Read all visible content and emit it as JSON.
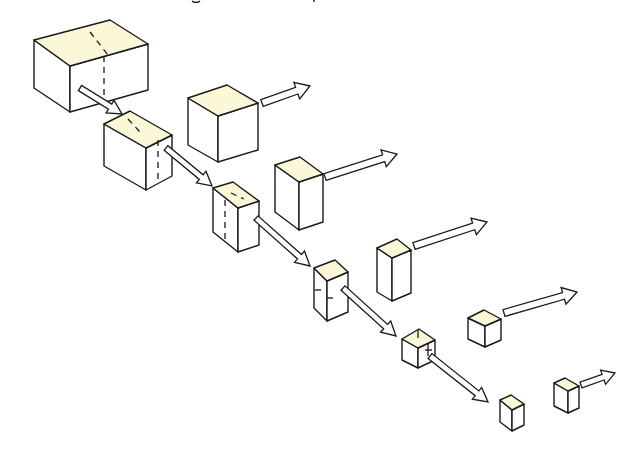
{
  "diagram": {
    "caption_clipped": true,
    "colors": {
      "top_face": "#fbf8d8",
      "side_face": "#ffffff",
      "stroke": "#1a1a1a",
      "background": "#ffffff"
    },
    "chain_boxes": [
      {
        "id": "box-1",
        "label": "original box",
        "split": "vertical-dashed",
        "top": [
          [
            34,
            40
          ],
          [
            110,
            20
          ],
          [
            148,
            44
          ],
          [
            70,
            66
          ]
        ],
        "left": [
          [
            34,
            40
          ],
          [
            70,
            66
          ],
          [
            70,
            112
          ],
          [
            34,
            88
          ]
        ],
        "front": [
          [
            70,
            66
          ],
          [
            148,
            44
          ],
          [
            148,
            90
          ],
          [
            70,
            112
          ]
        ],
        "dash_top": [
          [
            90,
            32
          ],
          [
            108,
            55
          ]
        ],
        "dash_front": [
          [
            104,
            56
          ],
          [
            104,
            104
          ]
        ]
      },
      {
        "id": "box-2",
        "label": "half 1",
        "split": "vertical-dashed",
        "top": [
          [
            104,
            124
          ],
          [
            130,
            111
          ],
          [
            172,
            135
          ],
          [
            146,
            148
          ]
        ],
        "left": [
          [
            104,
            124
          ],
          [
            146,
            148
          ],
          [
            146,
            190
          ],
          [
            104,
            166
          ]
        ],
        "front": [
          [
            146,
            148
          ],
          [
            172,
            135
          ],
          [
            172,
            176
          ],
          [
            146,
            190
          ]
        ],
        "dash_top": [
          [
            128,
            119
          ],
          [
            140,
            132
          ]
        ],
        "dash_front": [
          [
            158,
            140
          ],
          [
            158,
            182
          ]
        ]
      },
      {
        "id": "box-3",
        "label": "half 2",
        "split": "vertical-dashed",
        "top": [
          [
            213,
            188
          ],
          [
            233,
            182
          ],
          [
            259,
            201
          ],
          [
            238,
            208
          ]
        ],
        "left": [
          [
            213,
            188
          ],
          [
            238,
            208
          ],
          [
            238,
            252
          ],
          [
            213,
            232
          ]
        ],
        "front": [
          [
            238,
            208
          ],
          [
            259,
            201
          ],
          [
            259,
            245
          ],
          [
            238,
            252
          ]
        ],
        "dash_top": [
          [
            231,
            193
          ],
          [
            244,
            199
          ]
        ],
        "dash_front": [
          [
            225,
            200
          ],
          [
            225,
            243
          ]
        ]
      },
      {
        "id": "box-4",
        "label": "half 3",
        "split": "horizontal-ticks",
        "top": [
          [
            314,
            268
          ],
          [
            335,
            260
          ],
          [
            348,
            272
          ],
          [
            327,
            281
          ]
        ],
        "left": [
          [
            314,
            268
          ],
          [
            327,
            281
          ],
          [
            327,
            321
          ],
          [
            314,
            308
          ]
        ],
        "front": [
          [
            327,
            281
          ],
          [
            348,
            272
          ],
          [
            348,
            312
          ],
          [
            327,
            321
          ]
        ],
        "ticks": [
          [
            [
              315,
              290
            ],
            [
              321,
              290
            ]
          ],
          [
            [
              327,
              298
            ],
            [
              333,
              298
            ]
          ]
        ]
      },
      {
        "id": "box-5",
        "label": "half 4",
        "split": "horizontal-ticks",
        "top": [
          [
            402,
            339
          ],
          [
            419,
            329
          ],
          [
            435,
            340
          ],
          [
            418,
            348
          ]
        ],
        "left": [
          [
            402,
            339
          ],
          [
            418,
            348
          ],
          [
            418,
            368
          ],
          [
            402,
            360
          ]
        ],
        "front": [
          [
            418,
            348
          ],
          [
            435,
            340
          ],
          [
            435,
            360
          ],
          [
            418,
            368
          ]
        ],
        "ticks": [
          [
            [
              418,
              330
            ],
            [
              418,
              338
            ]
          ],
          [
            [
              428,
              344
            ],
            [
              428,
              356
            ]
          ],
          [
            [
              425,
              350
            ],
            [
              432,
              350
            ]
          ]
        ]
      },
      {
        "id": "box-6",
        "label": "half 5",
        "top": [
          [
            500,
            400
          ],
          [
            511,
            395
          ],
          [
            524,
            404
          ],
          [
            512,
            410
          ]
        ],
        "left": [
          [
            500,
            400
          ],
          [
            512,
            410
          ],
          [
            512,
            431
          ],
          [
            500,
            422
          ]
        ],
        "front": [
          [
            512,
            410
          ],
          [
            524,
            404
          ],
          [
            524,
            425
          ],
          [
            512,
            431
          ]
        ]
      }
    ],
    "removed_halves": [
      {
        "id": "piece-1",
        "label": "removed half 1",
        "top": [
          [
            188,
            98
          ],
          [
            227,
            85
          ],
          [
            258,
            103
          ],
          [
            218,
            116
          ]
        ],
        "left": [
          [
            188,
            98
          ],
          [
            218,
            116
          ],
          [
            218,
            162
          ],
          [
            188,
            145
          ]
        ],
        "front": [
          [
            218,
            116
          ],
          [
            258,
            103
          ],
          [
            258,
            150
          ],
          [
            218,
            162
          ]
        ]
      },
      {
        "id": "piece-2",
        "label": "removed half 2",
        "top": [
          [
            275,
            165
          ],
          [
            300,
            157
          ],
          [
            323,
            174
          ],
          [
            299,
            182
          ]
        ],
        "left": [
          [
            275,
            165
          ],
          [
            299,
            182
          ],
          [
            299,
            230
          ],
          [
            275,
            212
          ]
        ],
        "front": [
          [
            299,
            182
          ],
          [
            323,
            174
          ],
          [
            323,
            222
          ],
          [
            299,
            230
          ]
        ]
      },
      {
        "id": "piece-3",
        "label": "removed half 3",
        "top": [
          [
            377,
            248
          ],
          [
            397,
            239
          ],
          [
            411,
            250
          ],
          [
            392,
            258
          ]
        ],
        "left": [
          [
            377,
            248
          ],
          [
            392,
            258
          ],
          [
            392,
            301
          ],
          [
            377,
            292
          ]
        ],
        "front": [
          [
            392,
            258
          ],
          [
            411,
            250
          ],
          [
            411,
            293
          ],
          [
            392,
            301
          ]
        ]
      },
      {
        "id": "piece-4",
        "label": "removed half 4",
        "top": [
          [
            468,
            318
          ],
          [
            484,
            310
          ],
          [
            501,
            319
          ],
          [
            485,
            326
          ]
        ],
        "left": [
          [
            468,
            318
          ],
          [
            485,
            326
          ],
          [
            485,
            347
          ],
          [
            468,
            339
          ]
        ],
        "front": [
          [
            485,
            326
          ],
          [
            501,
            319
          ],
          [
            501,
            340
          ],
          [
            485,
            347
          ]
        ]
      },
      {
        "id": "piece-5",
        "label": "removed half 5",
        "top": [
          [
            554,
            383
          ],
          [
            565,
            378
          ],
          [
            579,
            386
          ],
          [
            568,
            391
          ]
        ],
        "left": [
          [
            554,
            383
          ],
          [
            568,
            391
          ],
          [
            568,
            413
          ],
          [
            554,
            406
          ]
        ],
        "front": [
          [
            568,
            391
          ],
          [
            579,
            386
          ],
          [
            579,
            408
          ],
          [
            568,
            413
          ]
        ]
      }
    ],
    "arrows": [
      {
        "id": "arrow-chain-1",
        "kind": "chain",
        "from": [
          80,
          88
        ],
        "to": [
          122,
          114
        ],
        "width": 6
      },
      {
        "id": "arrow-chain-2",
        "kind": "chain",
        "from": [
          166,
          148
        ],
        "to": [
          212,
          186
        ],
        "width": 6
      },
      {
        "id": "arrow-chain-3",
        "kind": "chain",
        "from": [
          256,
          218
        ],
        "to": [
          310,
          266
        ],
        "width": 6
      },
      {
        "id": "arrow-chain-4",
        "kind": "chain",
        "from": [
          343,
          288
        ],
        "to": [
          396,
          336
        ],
        "width": 6
      },
      {
        "id": "arrow-chain-5",
        "kind": "chain",
        "from": [
          430,
          356
        ],
        "to": [
          488,
          402
        ],
        "width": 6
      },
      {
        "id": "arrow-out-1",
        "kind": "removed",
        "from": [
          262,
          103
        ],
        "to": [
          310,
          86
        ],
        "width": 7
      },
      {
        "id": "arrow-out-2",
        "kind": "removed",
        "from": [
          325,
          177
        ],
        "to": [
          397,
          154
        ],
        "width": 7
      },
      {
        "id": "arrow-out-3",
        "kind": "removed",
        "from": [
          414,
          246
        ],
        "to": [
          487,
          222
        ],
        "width": 7
      },
      {
        "id": "arrow-out-4",
        "kind": "removed",
        "from": [
          504,
          313
        ],
        "to": [
          577,
          292
        ],
        "width": 7
      },
      {
        "id": "arrow-out-5",
        "kind": "removed",
        "from": [
          581,
          385
        ],
        "to": [
          615,
          373
        ],
        "width": 6
      }
    ]
  }
}
